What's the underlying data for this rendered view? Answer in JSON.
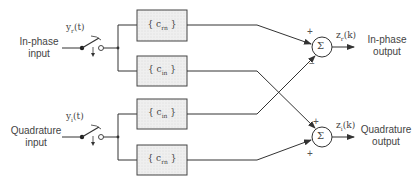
{
  "diagram": {
    "type": "complex equalizer block diagram",
    "inputs": [
      {
        "id": "inphase",
        "label_line1": "In-phase",
        "label_line2": "input",
        "signal": "y",
        "signal_sub": "r",
        "signal_arg": "(t)"
      },
      {
        "id": "quadrature",
        "label_line1": "Quadrature",
        "label_line2": "input",
        "signal": "y",
        "signal_sub": "i",
        "signal_arg": "(t)"
      }
    ],
    "filters": [
      {
        "id": "f1",
        "open": "{",
        "c": "c",
        "sub": "rn",
        "close": "}"
      },
      {
        "id": "f2",
        "open": "{",
        "c": "c",
        "sub": "in",
        "close": "}"
      },
      {
        "id": "f3",
        "open": "{",
        "c": "c",
        "sub": "in",
        "close": "}"
      },
      {
        "id": "f4",
        "open": "{",
        "c": "c",
        "sub": "rn",
        "close": "}"
      }
    ],
    "summers": [
      {
        "id": "s1",
        "symbol": "Σ",
        "sign_top": "+",
        "sign_bottom": "−"
      },
      {
        "id": "s2",
        "symbol": "Σ",
        "sign_top": "+",
        "sign_bottom": "+"
      }
    ],
    "outputs": [
      {
        "id": "inphase_out",
        "label_line1": "In-phase",
        "label_line2": "output",
        "signal": "z",
        "signal_sub": "r",
        "signal_arg": "(k)"
      },
      {
        "id": "quadrature_out",
        "label_line1": "Quadrature",
        "label_line2": "output",
        "signal": "z",
        "signal_sub": "i",
        "signal_arg": "(k)"
      }
    ],
    "colors": {
      "line": "#333333",
      "box_fill": "#e8e8e8",
      "box_stroke": "#444444"
    }
  }
}
